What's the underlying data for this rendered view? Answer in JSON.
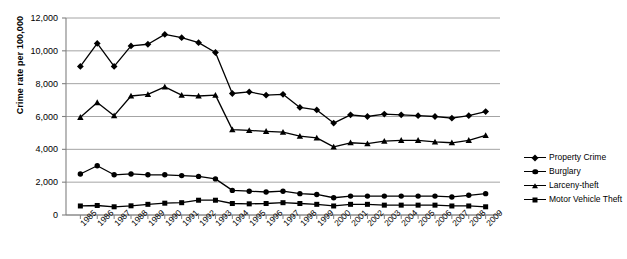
{
  "chart_data": {
    "type": "line",
    "title": "",
    "xlabel": "",
    "ylabel": "Crime rate per 100,000",
    "ylim": [
      0,
      12000
    ],
    "ytick_step": 2000,
    "yticks": [
      "0",
      "2,000",
      "4,000",
      "6,000",
      "8,000",
      "10,000",
      "12,000"
    ],
    "grid": true,
    "legend_position": "right",
    "categories": [
      "1985",
      "1986",
      "1987",
      "1988",
      "1989",
      "1990",
      "1991",
      "1992",
      "1993",
      "1994",
      "1995",
      "1996",
      "1997",
      "1998",
      "1999",
      "2000",
      "2001",
      "2002",
      "2003",
      "2004",
      "2005",
      "2006",
      "2007",
      "2008",
      "2009"
    ],
    "series": [
      {
        "name": "Property Crime",
        "marker": "diamond",
        "color": "#000000",
        "values": [
          9050,
          10450,
          9050,
          10300,
          10400,
          11000,
          10800,
          10500,
          9900,
          7400,
          7500,
          7300,
          7350,
          6550,
          6400,
          5600,
          6100,
          6000,
          6150,
          6100,
          6050,
          6000,
          5900,
          6050,
          6300
        ]
      },
      {
        "name": "Burglary",
        "marker": "circle",
        "color": "#000000",
        "values": [
          2500,
          3000,
          2450,
          2500,
          2450,
          2450,
          2400,
          2350,
          2200,
          1500,
          1450,
          1400,
          1450,
          1300,
          1250,
          1050,
          1150,
          1150,
          1150,
          1150,
          1150,
          1150,
          1100,
          1200,
          1300
        ]
      },
      {
        "name": "Larceny-theft",
        "marker": "triangle",
        "color": "#000000",
        "values": [
          5950,
          6850,
          6050,
          7250,
          7350,
          7800,
          7300,
          7250,
          7300,
          5200,
          5150,
          5100,
          5050,
          4800,
          4700,
          4150,
          4400,
          4350,
          4500,
          4550,
          4550,
          4450,
          4400,
          4550,
          4850
        ]
      },
      {
        "name": "Motor Vehicle Theft",
        "marker": "square",
        "color": "#000000",
        "values": [
          550,
          580,
          500,
          560,
          650,
          720,
          750,
          900,
          900,
          700,
          680,
          700,
          750,
          700,
          650,
          550,
          650,
          650,
          600,
          600,
          600,
          600,
          550,
          550,
          500
        ]
      }
    ]
  },
  "legend": {
    "items": [
      {
        "label": "Property Crime",
        "marker": "diamond-marker-icon"
      },
      {
        "label": "Burglary",
        "marker": "circle-marker-icon"
      },
      {
        "label": "Larceny-theft",
        "marker": "triangle-marker-icon"
      },
      {
        "label": "Motor Vehicle Theft",
        "marker": "square-marker-icon"
      }
    ]
  },
  "style": {
    "axis_color": "#808080",
    "grid_color": "#9a9a9a",
    "line_color": "#000000",
    "background": "#ffffff"
  }
}
